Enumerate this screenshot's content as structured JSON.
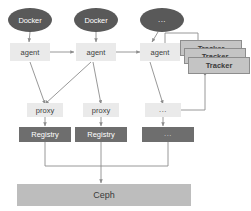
{
  "diagram": {
    "colors": {
      "node_dark": "#595959",
      "node_light": "#eaeaea",
      "registry_dark": "#6e6e6e",
      "tracker_gray": "#c4c4c4",
      "ceph_gray": "#bdbdbd",
      "edge": "#8c8c8c",
      "background": "#ffffff"
    },
    "sources": [
      {
        "id": "docker-1",
        "label": "Docker"
      },
      {
        "id": "docker-2",
        "label": "Docker"
      },
      {
        "id": "docker-3",
        "label": "..."
      }
    ],
    "agents": [
      {
        "id": "agent-1",
        "label": "agent"
      },
      {
        "id": "agent-2",
        "label": "agent"
      },
      {
        "id": "agent-3",
        "label": "agent"
      }
    ],
    "proxies": [
      {
        "id": "proxy-1",
        "label": "proxy"
      },
      {
        "id": "proxy-2",
        "label": "proxy"
      },
      {
        "id": "proxy-3",
        "label": "..."
      }
    ],
    "registries": [
      {
        "id": "registry-1",
        "label": "Registry"
      },
      {
        "id": "registry-2",
        "label": "Registry"
      },
      {
        "id": "registry-3",
        "label": "..."
      }
    ],
    "trackers": [
      {
        "id": "tracker-back",
        "label": "Tracker"
      },
      {
        "id": "tracker-mid",
        "label": "Tracker"
      },
      {
        "id": "tracker-front",
        "label": "Tracker"
      }
    ],
    "storage": {
      "id": "ceph",
      "label": "Ceph"
    }
  }
}
